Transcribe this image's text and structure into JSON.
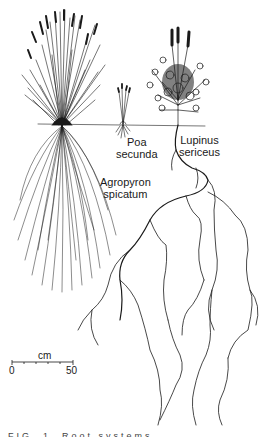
{
  "figure": {
    "type": "botanical root-system illustration",
    "ground_line_y": 125,
    "ink_color": "#1a1a1a"
  },
  "labels": {
    "poa": {
      "line1": "Poa",
      "line2": "secunda"
    },
    "lupinus": {
      "line1": "Lupinus",
      "line2": "sericeus"
    },
    "agropyron": {
      "line1": "Agropyron",
      "line2": "spicatum"
    }
  },
  "scale_bar": {
    "unit": "cm",
    "start": "0",
    "end": "50"
  },
  "caption": {
    "text": "FIG. 1. Root systems ..."
  }
}
